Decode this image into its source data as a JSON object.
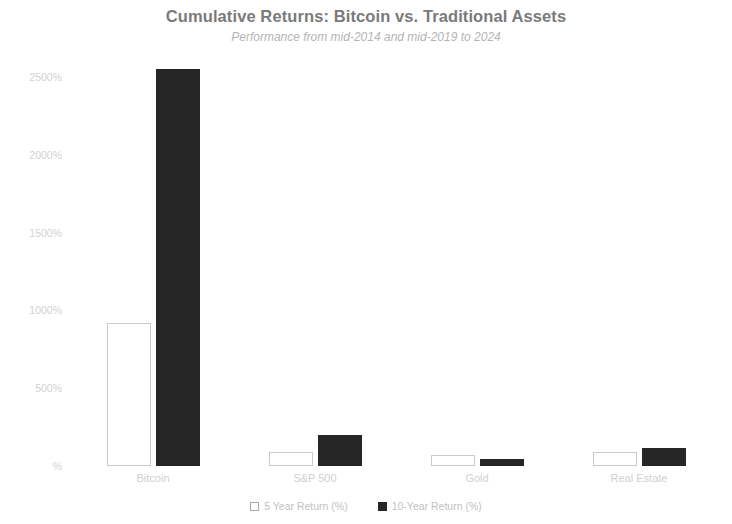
{
  "chart_data": {
    "type": "bar",
    "title": "Cumulative Returns: Bitcoin vs. Traditional Assets",
    "subtitle": "Performance from mid-2014 and mid-2019 to 2024",
    "xlabel": "",
    "ylabel": "",
    "categories": [
      "Bitcoin",
      "S&P 500",
      "Gold",
      "Real Estate"
    ],
    "series": [
      {
        "name": "5 Year Return (%)",
        "color": "#ffffff",
        "edge_color": "#c9c9c9",
        "values": [
          920,
          90,
          70,
          90
        ]
      },
      {
        "name": "10-Year Return (%)",
        "color": "#262626",
        "edge_color": "#262626",
        "values": [
          2550,
          200,
          45,
          115
        ]
      }
    ],
    "ylim": [
      0,
      2610
    ],
    "yticks": [
      0,
      500,
      1000,
      1500,
      2000,
      2500
    ],
    "ytick_labels": [
      "%",
      "500%",
      "1000%",
      "1500%",
      "2000%",
      "2500%"
    ],
    "grid": false,
    "legend_position": "bottom",
    "value_suffix": "%"
  },
  "legend": {
    "items": [
      {
        "label": "5 Year Return (%)",
        "swatch": "open-square-swatch"
      },
      {
        "label": "10-Year Return (%)",
        "swatch": "filled-square-swatch"
      }
    ]
  }
}
